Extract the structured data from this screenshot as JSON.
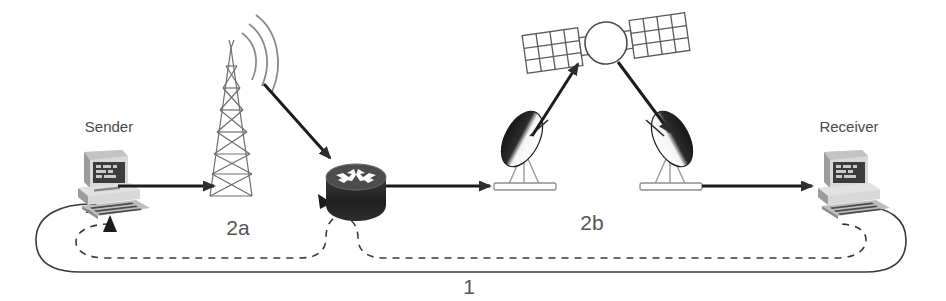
{
  "diagram": {
    "background_color": "#ffffff",
    "line_color": "#1c1c1c",
    "label_color": "#4a4a4a"
  },
  "nodes": {
    "sender": {
      "label": "Sender",
      "icon": "desktop-computer-icon"
    },
    "tower": {
      "label": "",
      "icon": "radio-tower-icon"
    },
    "router": {
      "label": "",
      "icon": "router-icon"
    },
    "dish_left": {
      "label": "",
      "icon": "satellite-dish-icon"
    },
    "satellite": {
      "label": "",
      "icon": "satellite-icon"
    },
    "dish_right": {
      "label": "",
      "icon": "satellite-dish-icon"
    },
    "receiver": {
      "label": "Receiver",
      "icon": "desktop-computer-icon"
    }
  },
  "paths": {
    "path_2a": {
      "label": "2a",
      "style": "dashed"
    },
    "path_2b": {
      "label": "2b",
      "style": "dashed"
    },
    "path_1": {
      "label": "1",
      "style": "solid"
    }
  },
  "links": {
    "sender_to_tower": {
      "style": "solid-arrow"
    },
    "tower_to_router": {
      "style": "solid-arrow"
    },
    "router_to_dish_left": {
      "style": "solid-arrow"
    },
    "dish_left_to_satellite": {
      "style": "solid-arrow"
    },
    "satellite_to_dish_right": {
      "style": "solid-arrow"
    },
    "dish_right_to_receiver": {
      "style": "solid-arrow"
    }
  }
}
